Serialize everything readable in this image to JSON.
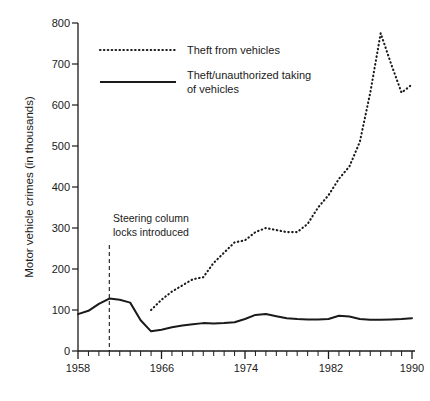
{
  "chart_data": {
    "type": "line",
    "title": "",
    "xlabel": "",
    "ylabel": "Motor vehicle crimes (in thousands)",
    "xlim": [
      1958,
      1990
    ],
    "ylim": [
      0,
      800
    ],
    "yticks": [
      0,
      100,
      200,
      300,
      400,
      500,
      600,
      700,
      800
    ],
    "ytick_labels": [
      "0",
      "100",
      "200",
      "300",
      "400",
      "500",
      "600",
      "700",
      "800"
    ],
    "xticks": [
      1958,
      1966,
      1974,
      1982,
      1990
    ],
    "xtick_labels": [
      "1958",
      "1966",
      "1974",
      "1982",
      "1990"
    ],
    "x_minor_tick_interval": 1,
    "grid": false,
    "legend_position": "top-center",
    "series": [
      {
        "name": "Theft from vehicles",
        "style": "dotted",
        "color": "#1a1a1a",
        "x": [
          1965,
          1966,
          1967,
          1968,
          1969,
          1970,
          1971,
          1972,
          1973,
          1974,
          1975,
          1976,
          1977,
          1978,
          1979,
          1980,
          1981,
          1982,
          1983,
          1984,
          1985,
          1986,
          1987,
          1988,
          1989,
          1990
        ],
        "values": [
          100,
          125,
          145,
          160,
          175,
          180,
          215,
          240,
          265,
          270,
          290,
          300,
          295,
          290,
          290,
          310,
          350,
          380,
          420,
          450,
          510,
          630,
          775,
          700,
          630,
          650
        ]
      },
      {
        "name": "Theft/unauthorized taking of vehicles",
        "style": "solid",
        "color": "#1a1a1a",
        "x": [
          1958,
          1959,
          1960,
          1961,
          1962,
          1963,
          1964,
          1965,
          1966,
          1967,
          1968,
          1969,
          1970,
          1971,
          1972,
          1973,
          1974,
          1975,
          1976,
          1977,
          1978,
          1979,
          1980,
          1981,
          1982,
          1983,
          1984,
          1985,
          1986,
          1987,
          1988,
          1989,
          1990
        ],
        "values": [
          90,
          98,
          115,
          128,
          125,
          118,
          75,
          48,
          52,
          58,
          62,
          65,
          68,
          67,
          68,
          70,
          78,
          88,
          90,
          85,
          80,
          78,
          77,
          77,
          78,
          86,
          84,
          78,
          76,
          76,
          77,
          78,
          80
        ]
      }
    ],
    "annotations": [
      {
        "name": "steering-column-locks",
        "text_line1": "Steering column",
        "text_line2": "locks introduced",
        "x": 1961,
        "marker": "vertical-dashed-line"
      }
    ]
  },
  "legend": {
    "items": [
      {
        "label": "Theft from vehicles",
        "style": "dotted"
      },
      {
        "label": "Theft/unauthorized taking",
        "label2": "of vehicles",
        "style": "solid"
      }
    ]
  },
  "colors": {
    "ink": "#1a1a1a",
    "background": "#ffffff"
  }
}
